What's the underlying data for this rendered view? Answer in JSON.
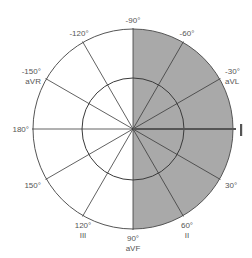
{
  "diagram": {
    "colors": {
      "shaded_fill": "#a9a9a9",
      "line": "#3a3a3a",
      "circle": "#555555",
      "label": "#555555",
      "highlight_axis": "#555555"
    },
    "shaded_region": {
      "from_deg": -90,
      "to_deg": 90,
      "description": "right half shaded"
    },
    "highlighted_axis": {
      "angle_deg": 0,
      "label": "I"
    },
    "axes": [
      {
        "angle_deg": -90,
        "degree_label": "-90°",
        "lead": ""
      },
      {
        "angle_deg": -60,
        "degree_label": "-60°",
        "lead": ""
      },
      {
        "angle_deg": -30,
        "degree_label": "-30°",
        "lead": "aVL"
      },
      {
        "angle_deg": 0,
        "degree_label": "",
        "lead": "I"
      },
      {
        "angle_deg": 30,
        "degree_label": "30°",
        "lead": ""
      },
      {
        "angle_deg": 60,
        "degree_label": "60°",
        "lead": "II"
      },
      {
        "angle_deg": 90,
        "degree_label": "90°",
        "lead": "aVF"
      },
      {
        "angle_deg": 120,
        "degree_label": "120°",
        "lead": "III"
      },
      {
        "angle_deg": 150,
        "degree_label": "150°",
        "lead": ""
      },
      {
        "angle_deg": 180,
        "degree_label": "180°",
        "lead": ""
      },
      {
        "angle_deg": -150,
        "degree_label": "-150°",
        "lead": "aVR"
      },
      {
        "angle_deg": -120,
        "degree_label": "-120°",
        "lead": ""
      }
    ]
  }
}
